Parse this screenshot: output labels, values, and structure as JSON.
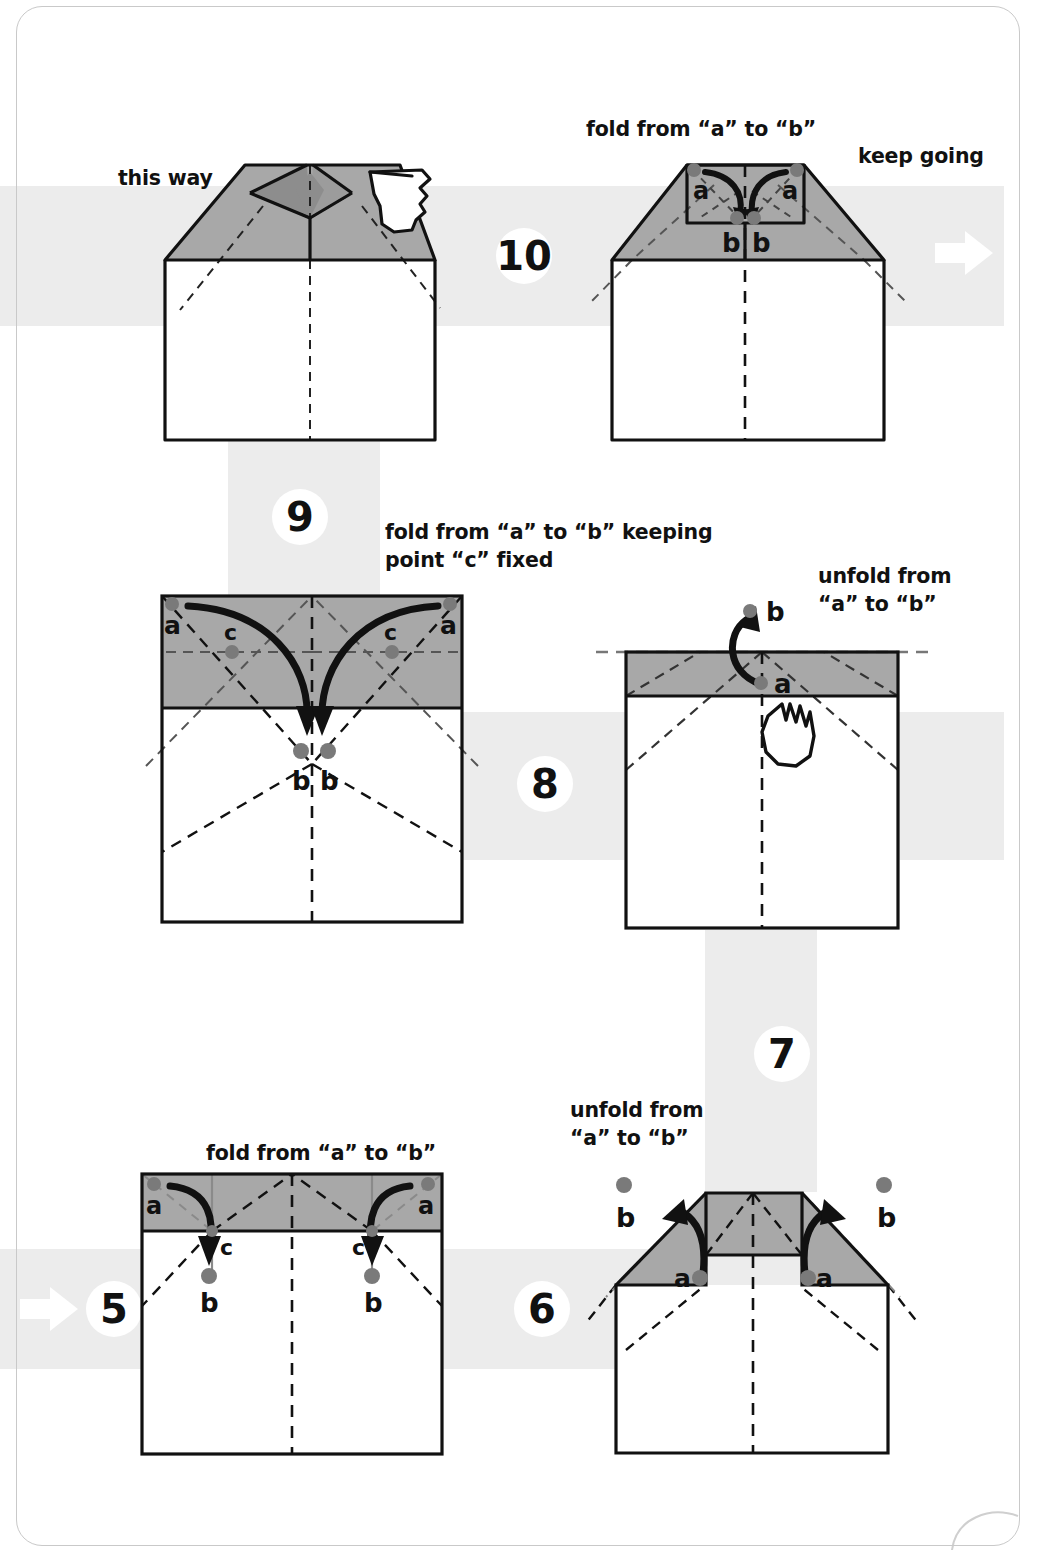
{
  "page": {
    "border_color": "#c9c9c9",
    "band_color": "#ececec",
    "paper_front_color": "#ffffff",
    "paper_back_color": "#a8a8a8",
    "paper_back_dark_color": "#8d8d8d",
    "line_color": "#111111",
    "dot_color": "#7a7a7a"
  },
  "captions": {
    "this_way": "this way",
    "fold_a_to_b_top": "fold from “a” to “b”",
    "keep_going": "keep going",
    "fold_a_to_b_keeping_c": "fold from “a” to “b” keeping\npoint “c” fixed",
    "unfold_a_to_b_step8": "unfold from\n“a” to “b”",
    "fold_a_to_b_step5": "fold from “a” to “b”",
    "unfold_a_to_b_step6": "unfold from\n“a” to “b”"
  },
  "steps": {
    "s5": "5",
    "s6": "6",
    "s7": "7",
    "s8": "8",
    "s9": "9",
    "s10": "10"
  },
  "labels": {
    "a": "a",
    "b": "b",
    "c": "c"
  },
  "figures": [
    {
      "id": "fig-step10-result",
      "step_shown": "result of step 10",
      "caption": "this way",
      "description": "House shape with shaded trapezoid roof, inner diamond pleat being opened by a pointing hand",
      "point_labels": [],
      "has_hand": true
    },
    {
      "id": "fig-step10",
      "step_shown": "10",
      "caption": "fold from “a” to “b”",
      "description": "House shape with shaded roof and a small rectangle flap at top centre; two a points fold inward down to two b points",
      "point_labels": [
        "a",
        "a",
        "b",
        "b"
      ],
      "has_hand": false
    },
    {
      "id": "fig-step9",
      "step_shown": "9",
      "caption": "fold from “a” to “b” keeping point “c” fixed",
      "description": "Rectangle with shaded upper band, crossing crease lines; two a corners swing down along curved arrows to two b points below the band edge, pivoting at c",
      "point_labels": [
        "a",
        "a",
        "c",
        "c",
        "b",
        "b"
      ],
      "has_hand": false
    },
    {
      "id": "fig-step8",
      "step_shown": "8",
      "caption": "unfold from “a” to “b”",
      "description": "Rectangle with narrow shaded strip at top; point a swings up to b; a pointing hand holds the sheet",
      "point_labels": [
        "b",
        "a"
      ],
      "has_hand": true
    },
    {
      "id": "fig-step5",
      "step_shown": "5",
      "caption": "fold from “a” to “b”",
      "description": "Rectangle with shaded top band divided into thirds; outer a corners fold inward and down to b points, pivoting at the c points",
      "point_labels": [
        "a",
        "a",
        "c",
        "c",
        "b",
        "b"
      ],
      "has_hand": false
    },
    {
      "id": "fig-step6",
      "step_shown": "6",
      "caption": "unfold from “a” to “b”",
      "description": "Shape with raised centre block and two shaded triangular flaps; each a point swings outward and up to a b point",
      "point_labels": [
        "b",
        "a",
        "a",
        "b"
      ],
      "has_hand": false
    }
  ],
  "flow": {
    "direction": "serpentine: bottom-left 5 → 6 → up 7 → left 8 → up 9 → right 10 → keep going",
    "arrow_in_label": "flow-arrow-in",
    "arrow_out_label": "flow-arrow-out"
  }
}
